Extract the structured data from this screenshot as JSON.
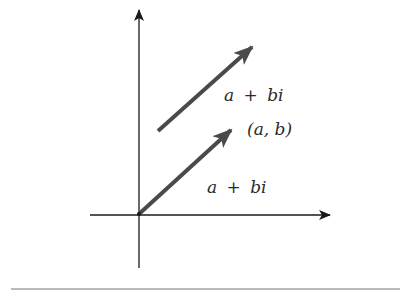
{
  "diagram": {
    "type": "complex-plane-vector",
    "colors": {
      "axis": "#1a1a1a",
      "vector": "#4a4a4a",
      "text": "#2a2a2a",
      "rule": "#777777",
      "background": "#ffffff"
    },
    "axes": {
      "origin": [
        139,
        214
      ],
      "x_axis": {
        "from": [
          90,
          215
        ],
        "to": [
          330,
          215
        ]
      },
      "y_axis": {
        "from": [
          139,
          268
        ],
        "to": [
          139,
          10
        ]
      }
    },
    "vectors": [
      {
        "id": "translated-vector",
        "from": [
          158,
          131
        ],
        "to": [
          252,
          47
        ],
        "label": "a + bi"
      },
      {
        "id": "position-vector",
        "from": [
          139,
          214
        ],
        "to": [
          231,
          130
        ],
        "label": "a + bi"
      }
    ],
    "labels": {
      "upper_vector": {
        "a": "a",
        "op": "+",
        "b": "bi"
      },
      "point": "(a, b)",
      "lower_vector": {
        "a": "a",
        "op": "+",
        "b": "bi"
      }
    },
    "rule": {
      "from": [
        11,
        289
      ],
      "to": [
        400,
        289
      ]
    }
  }
}
